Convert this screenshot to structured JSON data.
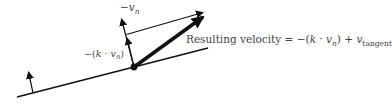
{
  "diagram": {
    "type": "vector-diagram",
    "stroke_color": "#111111",
    "text_color": "#444444",
    "labels": {
      "negative_vn": {
        "prefix": "−",
        "var": "v",
        "sub": "n"
      },
      "scaled_normal": {
        "prefix": "−(",
        "k": "k",
        "dot": " · ",
        "var": "v",
        "sub": "n",
        "suffix": ")"
      },
      "resulting_velocity": {
        "text": "Resulting velocity",
        "equals": " = −(",
        "k": "k",
        "dot": " · ",
        "var": "v",
        "sub": "n",
        "close": ") + ",
        "var2": "v",
        "sub2": "tangent"
      }
    },
    "elements": [
      {
        "name": "surface-line",
        "from": [
          17,
          97
        ],
        "to": [
          208,
          48
        ]
      },
      {
        "name": "surface-normal-arrow",
        "from": [
          33,
          93
        ],
        "to": [
          28,
          71
        ]
      },
      {
        "name": "contact-point",
        "at": [
          134,
          67
        ]
      },
      {
        "name": "negative-vn-arrow",
        "from": [
          134,
          67
        ],
        "to": [
          121,
          18
        ]
      },
      {
        "name": "scaled-normal-arrow",
        "from": [
          134,
          67
        ],
        "to": [
          127,
          37
        ]
      },
      {
        "name": "tangent-component-arrow",
        "from": [
          127,
          34
        ],
        "to": [
          203,
          12
        ]
      },
      {
        "name": "resulting-velocity-arrow",
        "from": [
          134,
          67
        ],
        "to": [
          203,
          17
        ]
      }
    ]
  }
}
